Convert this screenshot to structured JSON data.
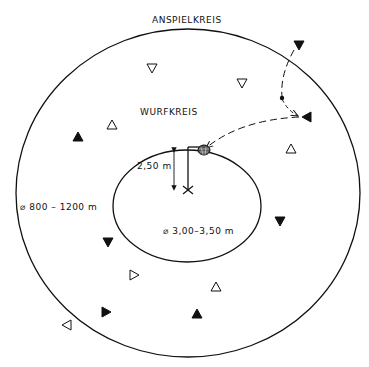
{
  "labels": {
    "outer_circle": "ANSPIELKREIS",
    "inner_circle": "WURFKREIS",
    "outer_diameter": "⌀ 800 – 1200 m",
    "inner_diameter": "⌀ 3,00–3,50 m",
    "basket_height": "2,50 m"
  },
  "colors": {
    "line": "#111111",
    "background": "#ffffff"
  },
  "players": [
    {
      "type": "hollow",
      "dir": "down",
      "x": 152,
      "y": 68
    },
    {
      "type": "hollow",
      "dir": "down",
      "x": 242,
      "y": 83
    },
    {
      "type": "filled",
      "dir": "down",
      "x": 299,
      "y": 45
    },
    {
      "type": "filled",
      "dir": "left",
      "x": 307,
      "y": 117
    },
    {
      "type": "hollow",
      "dir": "up",
      "x": 291,
      "y": 149
    },
    {
      "type": "hollow",
      "dir": "up",
      "x": 112,
      "y": 125
    },
    {
      "type": "filled",
      "dir": "up",
      "x": 78,
      "y": 137
    },
    {
      "type": "filled",
      "dir": "down",
      "x": 280,
      "y": 221
    },
    {
      "type": "filled",
      "dir": "down",
      "x": 108,
      "y": 242
    },
    {
      "type": "hollow",
      "dir": "right",
      "x": 134,
      "y": 275
    },
    {
      "type": "hollow",
      "dir": "up",
      "x": 216,
      "y": 287
    },
    {
      "type": "filled",
      "dir": "right",
      "x": 106,
      "y": 312
    },
    {
      "type": "filled",
      "dir": "up",
      "x": 197,
      "y": 314
    },
    {
      "type": "hollow",
      "dir": "left",
      "x": 67,
      "y": 325
    }
  ]
}
